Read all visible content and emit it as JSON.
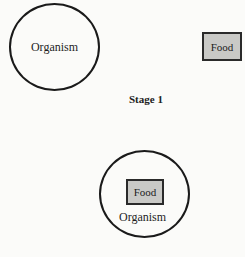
{
  "diagram": {
    "stage1": {
      "organism_label": "Organism",
      "food_label": "Food",
      "caption": "Stage 1"
    },
    "stage2": {
      "food_label": "Food",
      "organism_label": "Organism"
    },
    "colors": {
      "stroke": "#1a1a1a",
      "food_fill": "#c9c9c6",
      "background": "#fbfbf9"
    }
  }
}
